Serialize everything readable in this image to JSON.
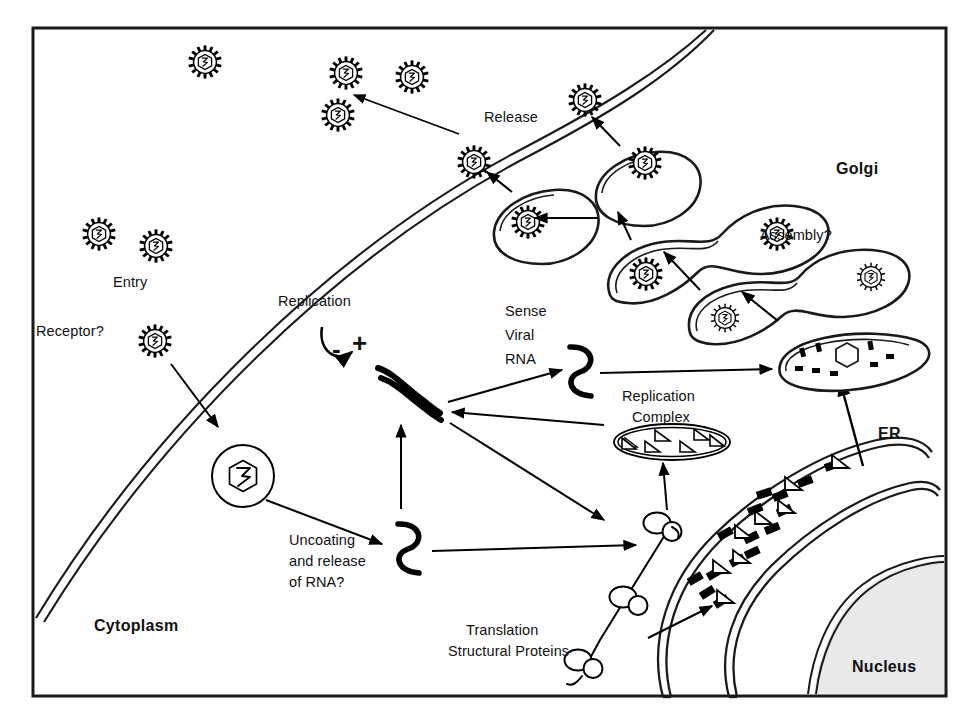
{
  "figure": {
    "domain": "biology-diagram",
    "background_color": "#ffffff",
    "stroke_color": "#000000",
    "nucleus_fill": "#e9e9e9"
  },
  "compartments": {
    "cytoplasm": "Cytoplasm",
    "nucleus": "Nucleus",
    "golgi": "Golgi",
    "er": "ER"
  },
  "steps": {
    "entry": "Entry",
    "receptor": "Receptor?",
    "uncoating": "Uncoating\nand release\nof RNA?",
    "uncoating_line1": "Uncoating",
    "uncoating_line2": "and release",
    "uncoating_line3": "of RNA?",
    "replication": "Replication",
    "replication_complex_line1": "Replication",
    "replication_complex_line2": "Complex",
    "sense_viral_rna_line1": "Sense",
    "sense_viral_rna_line2": "Viral",
    "sense_viral_rna_line3": "RNA",
    "translation_line1": "Translation",
    "translation_line2": "Structural Proteins",
    "assembly": "Assembly?",
    "release": "Release"
  },
  "strand_symbols": {
    "minus": "-",
    "plus": "+"
  },
  "counts": {
    "extracellular_virions": 6,
    "golgi_cisternae": 5,
    "ribosomes": 3,
    "replication_complex_triangles": 6
  }
}
